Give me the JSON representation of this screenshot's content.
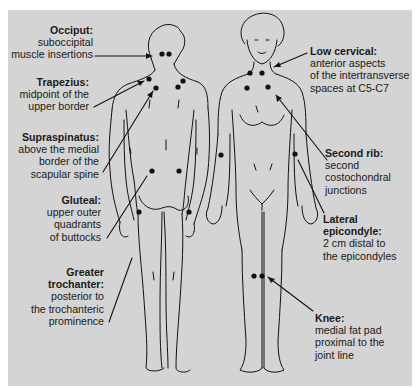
{
  "figure": {
    "background": "#d4d4d4",
    "line_color": "#111111",
    "point_color": "#111111",
    "views": [
      "posterior",
      "anterior"
    ]
  },
  "labels": {
    "occiput": {
      "title": "Occiput:",
      "desc": [
        "suboccipital",
        "muscle insertions"
      ]
    },
    "trapezius": {
      "title": "Trapezius:",
      "desc": [
        "midpoint of the",
        "upper border"
      ]
    },
    "supraspinatus": {
      "title": "Supraspinatus:",
      "desc": [
        "above the medial",
        "border of the",
        "scapular spine"
      ]
    },
    "gluteal": {
      "title": "Gluteal:",
      "desc": [
        "upper outer",
        "quadrants",
        "of buttocks"
      ]
    },
    "greater_trochanter": {
      "title_lines": [
        "Greater",
        "trochanter:"
      ],
      "desc": [
        "posterior to",
        "the trochanteric",
        "prominence"
      ]
    },
    "low_cervical": {
      "title": "Low cervical:",
      "desc": [
        "anterior aspects",
        "of the intertransverse",
        "spaces at C5-C7"
      ]
    },
    "second_rib": {
      "title": "Second rib:",
      "desc": [
        "second",
        "costochondral",
        "junctions"
      ]
    },
    "lateral_epicondyle": {
      "title_lines": [
        "Lateral",
        "epicondyle:"
      ],
      "desc": [
        "2 cm distal to",
        "the epicondyles"
      ]
    },
    "knee": {
      "title": "Knee:",
      "desc": [
        "medial fat pad",
        "proximal to the",
        "joint line"
      ]
    }
  }
}
